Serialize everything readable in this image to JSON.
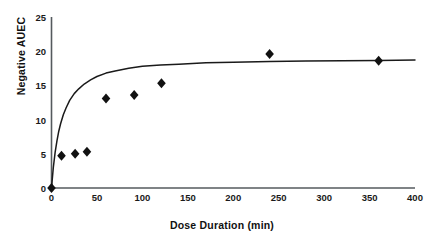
{
  "chart_data": {
    "type": "scatter",
    "title": "",
    "subtitle": "",
    "xlabel": "Dose Duration (min)",
    "ylabel": "Negative AUEC",
    "xlim": [
      0,
      400
    ],
    "ylim": [
      0,
      25
    ],
    "xticks": [
      "0",
      "50",
      "100",
      "150",
      "200",
      "250",
      "300",
      "350",
      "400"
    ],
    "xtick_values": [
      0,
      50,
      100,
      150,
      200,
      250,
      300,
      350,
      400
    ],
    "yticks": [
      "0",
      "5",
      "10",
      "15",
      "20",
      "25"
    ],
    "ytick_values": [
      0,
      5,
      10,
      15,
      20,
      25
    ],
    "grid": false,
    "legend": false,
    "legend_position": "none",
    "marker": "diamond",
    "marker_color": "#111111",
    "line_color": "#111111",
    "series": [
      {
        "name": "Observed",
        "type": "scatter",
        "x": [
          0,
          11,
          26,
          39,
          60,
          91,
          121,
          240,
          360
        ],
        "y": [
          0,
          4.7,
          5.0,
          5.3,
          13.1,
          13.6,
          15.3,
          19.6,
          18.6
        ]
      },
      {
        "name": "Fitted curve",
        "type": "line",
        "model": "Emax saturating",
        "emax": 18.7,
        "ed50": 22,
        "x": [
          0,
          2,
          4,
          6,
          8,
          10,
          13,
          16,
          20,
          25,
          30,
          36,
          43,
          50,
          60,
          70,
          85,
          100,
          120,
          140,
          170,
          200,
          240,
          280,
          320,
          360,
          400
        ],
        "y": [
          0,
          3.0,
          5.2,
          6.9,
          8.3,
          9.4,
          10.7,
          11.7,
          12.8,
          13.8,
          14.5,
          15.2,
          15.8,
          16.3,
          16.8,
          17.1,
          17.5,
          17.8,
          18.0,
          18.1,
          18.3,
          18.4,
          18.5,
          18.55,
          18.6,
          18.65,
          18.7
        ]
      }
    ]
  },
  "axes": {
    "x_title": "Dose Duration (min)",
    "y_title": "Negative AUEC"
  }
}
